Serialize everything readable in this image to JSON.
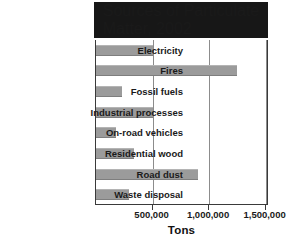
{
  "chart_data": {
    "type": "bar",
    "orientation": "horizontal",
    "title": "Sources of Particulate Matter, 2002",
    "title_line1": "Sources of Particulate",
    "title_line2": "Matter, 2002",
    "xlabel": "Tons",
    "ylabel": "",
    "categories": [
      "Electricity",
      "Fires",
      "Fossil fuels",
      "Industrial processes",
      "On-road vehicles",
      "Residential wood",
      "Road dust",
      "Waste disposal"
    ],
    "values": [
      500000,
      1250000,
      230000,
      500000,
      180000,
      340000,
      900000,
      290000
    ],
    "xlim": [
      0,
      1530000
    ],
    "xticks": [
      500000,
      1000000,
      1500000
    ],
    "xtick_labels": [
      "500,000",
      "1,000,000",
      "1,500,000"
    ],
    "grid": "vertical-only",
    "legend": "none",
    "colors": {
      "bar": "#9b9b9b",
      "title_background": "#171717",
      "title_text": "#ffffff",
      "axis": "#3a3a3a",
      "gridline": "#8c8c8c",
      "plot_background": "#ffffff"
    }
  }
}
